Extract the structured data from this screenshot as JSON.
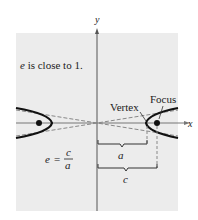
{
  "diagram": {
    "axis_x_label": "x",
    "axis_y_label": "y",
    "caption": "e is close to 1.",
    "caption_e": "e",
    "caption_rest": " is close to 1.",
    "vertex_label": "Vertex",
    "focus_label": "Focus",
    "a_label": "a",
    "c_label": "c",
    "formula": {
      "lhs": "e",
      "eq": "=",
      "numerator": "c",
      "denominator": "a"
    },
    "colors": {
      "panel": "#ececec",
      "curve": "#111111",
      "asymptote": "#888888",
      "axis": "#555555"
    }
  }
}
